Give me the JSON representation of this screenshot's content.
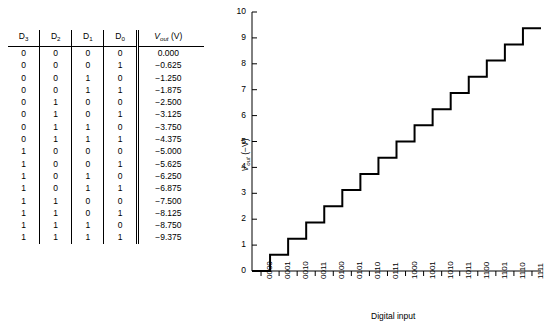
{
  "table": {
    "headers": [
      "D",
      "D",
      "D",
      "D",
      "Vout (V)"
    ],
    "header_labels": {
      "d3_base": "D",
      "d3_sub": "3",
      "d2_base": "D",
      "d2_sub": "2",
      "d1_base": "D",
      "d1_sub": "1",
      "d0_base": "D",
      "d0_sub": "0",
      "vout_base": "V",
      "vout_sub": "out",
      "vout_unit": "(V)"
    },
    "rows": [
      {
        "d3": "0",
        "d2": "0",
        "d1": "0",
        "d0": "0",
        "vout": "0.000"
      },
      {
        "d3": "0",
        "d2": "0",
        "d1": "0",
        "d0": "1",
        "vout": "−0.625"
      },
      {
        "d3": "0",
        "d2": "0",
        "d1": "1",
        "d0": "0",
        "vout": "−1.250"
      },
      {
        "d3": "0",
        "d2": "0",
        "d1": "1",
        "d0": "1",
        "vout": "−1.875"
      },
      {
        "d3": "0",
        "d2": "1",
        "d1": "0",
        "d0": "0",
        "vout": "−2.500"
      },
      {
        "d3": "0",
        "d2": "1",
        "d1": "0",
        "d0": "1",
        "vout": "−3.125"
      },
      {
        "d3": "0",
        "d2": "1",
        "d1": "1",
        "d0": "0",
        "vout": "−3.750"
      },
      {
        "d3": "0",
        "d2": "1",
        "d1": "1",
        "d0": "1",
        "vout": "−4.375"
      },
      {
        "d3": "1",
        "d2": "0",
        "d1": "0",
        "d0": "0",
        "vout": "−5.000"
      },
      {
        "d3": "1",
        "d2": "0",
        "d1": "0",
        "d0": "1",
        "vout": "−5.625"
      },
      {
        "d3": "1",
        "d2": "0",
        "d1": "1",
        "d0": "0",
        "vout": "−6.250"
      },
      {
        "d3": "1",
        "d2": "0",
        "d1": "1",
        "d0": "1",
        "vout": "−6.875"
      },
      {
        "d3": "1",
        "d2": "1",
        "d1": "0",
        "d0": "0",
        "vout": "−7.500"
      },
      {
        "d3": "1",
        "d2": "1",
        "d1": "0",
        "d0": "1",
        "vout": "−8.125"
      },
      {
        "d3": "1",
        "d2": "1",
        "d1": "1",
        "d0": "0",
        "vout": "−8.750"
      },
      {
        "d3": "1",
        "d2": "1",
        "d1": "1",
        "d0": "1",
        "vout": "−9.375"
      }
    ]
  },
  "chart_data": {
    "type": "line",
    "style": "staircase",
    "title": "",
    "xlabel": "Digital input",
    "ylabel": "Vout (−V)",
    "ylabel_parts": {
      "base": "V",
      "sub": "out",
      "unit": "(−V)"
    },
    "categories": [
      "0000",
      "0001",
      "0010",
      "0011",
      "0100",
      "0101",
      "0110",
      "0111",
      "1000",
      "1001",
      "1010",
      "1011",
      "1100",
      "1101",
      "1110",
      "1111"
    ],
    "values": [
      0.0,
      0.625,
      1.25,
      1.875,
      2.5,
      3.125,
      3.75,
      4.375,
      5.0,
      5.625,
      6.25,
      6.875,
      7.5,
      8.125,
      8.75,
      9.375
    ],
    "ylim": [
      0,
      10
    ],
    "yticks": [
      0,
      1,
      2,
      3,
      4,
      5,
      6,
      7,
      8,
      9,
      10
    ],
    "ytick_labels": [
      "0",
      "1",
      "2",
      "3",
      "4",
      "5",
      "6",
      "7",
      "8",
      "9",
      "10"
    ],
    "grid": false,
    "legend": null,
    "step_size": 0.625,
    "line_color": "#000000"
  },
  "colors": {
    "background": "#ffffff",
    "foreground": "#000000",
    "rule": "#000000"
  }
}
